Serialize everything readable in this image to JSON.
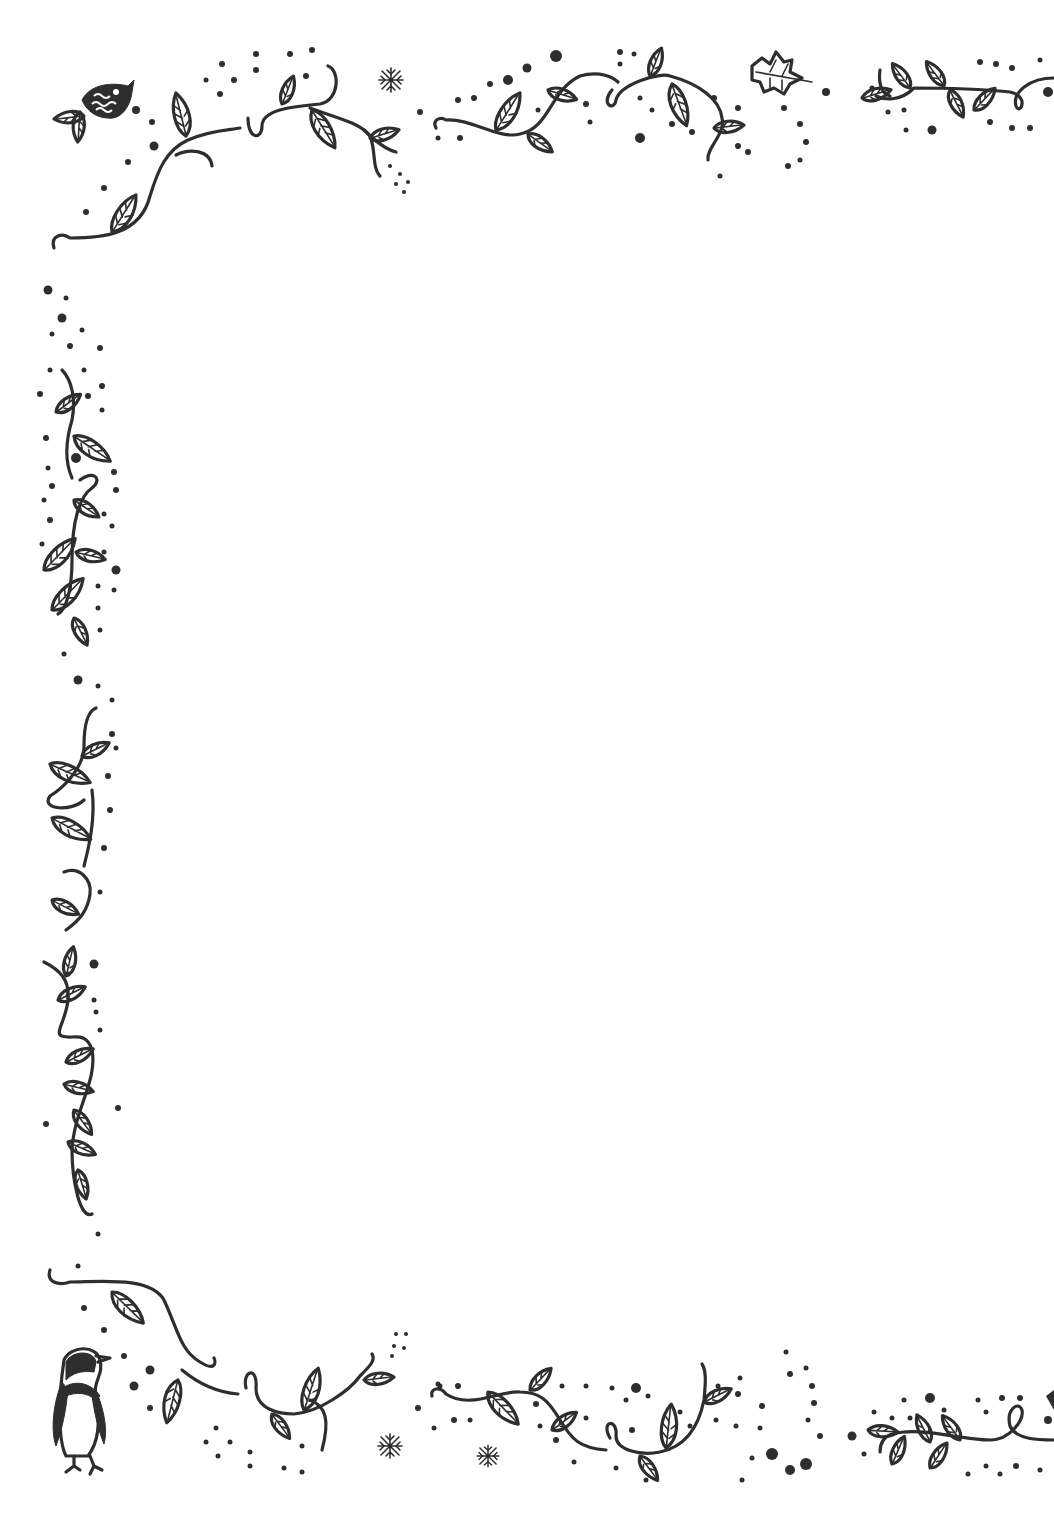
{
  "page": {
    "background": "#ffffff",
    "ink_color": "#2e2e2e",
    "style": "hand-drawn leafy vine border frame"
  },
  "decorations": {
    "top_left": [
      "fish-icon",
      "vine-icon",
      "snowflake-icon"
    ],
    "top_right": [
      "vine-icon",
      "maple-leaf-icon",
      "vine-icon"
    ],
    "left_side": [
      "vine-icon",
      "vine-icon",
      "vine-icon",
      "vine-icon"
    ],
    "bottom_left": [
      "penguin-icon",
      "vine-icon",
      "snowflake-icon"
    ],
    "bottom_right": [
      "vine-icon",
      "snowflake-icon",
      "vine-icon"
    ]
  },
  "content": {
    "text": ""
  }
}
